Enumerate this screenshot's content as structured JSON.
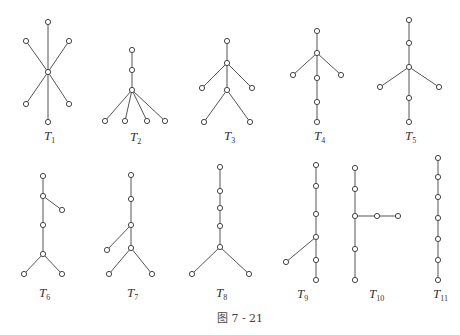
{
  "figure": {
    "caption": "图 7 - 21",
    "trees": [
      {
        "id": "T1",
        "label": "T",
        "subscript": "1",
        "nodes": 7,
        "edges": [
          [
            0,
            1
          ],
          [
            0,
            2
          ],
          [
            0,
            3
          ],
          [
            0,
            4
          ],
          [
            0,
            5
          ],
          [
            0,
            6
          ]
        ]
      },
      {
        "id": "T2",
        "label": "T",
        "subscript": "2",
        "nodes": 7,
        "edges": [
          [
            0,
            1
          ],
          [
            1,
            2
          ],
          [
            2,
            3
          ],
          [
            2,
            4
          ],
          [
            2,
            5
          ],
          [
            2,
            6
          ]
        ]
      },
      {
        "id": "T3",
        "label": "T",
        "subscript": "3",
        "nodes": 7,
        "edges": [
          [
            0,
            1
          ],
          [
            1,
            2
          ],
          [
            1,
            3
          ],
          [
            1,
            4
          ],
          [
            4,
            5
          ],
          [
            4,
            6
          ]
        ]
      },
      {
        "id": "T4",
        "label": "T",
        "subscript": "4",
        "nodes": 7,
        "edges": [
          [
            0,
            1
          ],
          [
            1,
            2
          ],
          [
            1,
            3
          ],
          [
            1,
            4
          ],
          [
            4,
            5
          ],
          [
            5,
            6
          ]
        ]
      },
      {
        "id": "T5",
        "label": "T",
        "subscript": "5",
        "nodes": 7,
        "edges": [
          [
            0,
            1
          ],
          [
            1,
            2
          ],
          [
            2,
            3
          ],
          [
            2,
            4
          ],
          [
            2,
            5
          ],
          [
            5,
            6
          ]
        ]
      },
      {
        "id": "T6",
        "label": "T",
        "subscript": "6",
        "nodes": 7,
        "edges": [
          [
            0,
            1
          ],
          [
            1,
            2
          ],
          [
            1,
            3
          ],
          [
            3,
            4
          ],
          [
            4,
            5
          ],
          [
            4,
            6
          ]
        ]
      },
      {
        "id": "T7",
        "label": "T",
        "subscript": "7",
        "nodes": 7,
        "edges": [
          [
            0,
            1
          ],
          [
            1,
            2
          ],
          [
            2,
            3
          ],
          [
            2,
            4
          ],
          [
            4,
            5
          ],
          [
            4,
            6
          ]
        ]
      },
      {
        "id": "T8",
        "label": "T",
        "subscript": "8",
        "nodes": 7,
        "edges": [
          [
            0,
            1
          ],
          [
            1,
            2
          ],
          [
            2,
            3
          ],
          [
            3,
            4
          ],
          [
            4,
            5
          ],
          [
            4,
            6
          ]
        ]
      },
      {
        "id": "T9",
        "label": "T",
        "subscript": "9",
        "nodes": 7,
        "edges": [
          [
            0,
            1
          ],
          [
            1,
            2
          ],
          [
            2,
            3
          ],
          [
            3,
            4
          ],
          [
            4,
            5
          ],
          [
            3,
            6
          ]
        ]
      },
      {
        "id": "T10",
        "label": "T",
        "subscript": "10",
        "nodes": 7,
        "edges": [
          [
            0,
            1
          ],
          [
            1,
            2
          ],
          [
            2,
            3
          ],
          [
            3,
            4
          ],
          [
            2,
            5
          ],
          [
            5,
            6
          ]
        ]
      },
      {
        "id": "T11",
        "label": "T",
        "subscript": "11",
        "nodes": 7,
        "edges": [
          [
            0,
            1
          ],
          [
            1,
            2
          ],
          [
            2,
            3
          ],
          [
            3,
            4
          ],
          [
            4,
            5
          ],
          [
            5,
            6
          ]
        ]
      }
    ]
  }
}
